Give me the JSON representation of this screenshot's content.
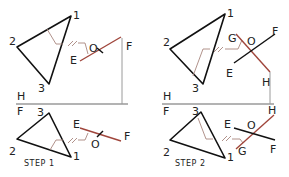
{
  "colors": {
    "triangle": "#111111",
    "cut_line": "#a0463c",
    "projection": "#a8867e",
    "fold_line": "#9a9a9a"
  },
  "fold_line_labels": {
    "upper": "H",
    "lower": "F"
  },
  "panels": [
    {
      "step_label": "STEP 1",
      "top_view": {
        "triangle_vertices": [
          "1",
          "2",
          "3"
        ],
        "line_endpoints": [
          "E",
          "F"
        ],
        "pierce_point": "O",
        "parallel_mark": "//"
      },
      "front_view": {
        "triangle_vertices": [
          "3",
          "2",
          "1"
        ],
        "line_endpoints": [
          "E",
          "F"
        ],
        "pierce_point": "O",
        "parallel_mark": "//"
      }
    },
    {
      "step_label": "STEP 2",
      "top_view": {
        "triangle_vertices": [
          "1",
          "2",
          "3"
        ],
        "line_endpoints": [
          "E",
          "F"
        ],
        "edge_view_points": [
          "G",
          "H"
        ],
        "pierce_point": "O",
        "parallel_mark": "//"
      },
      "front_view": {
        "triangle_vertices": [
          "3",
          "2",
          "1"
        ],
        "line_endpoints": [
          "E",
          "F"
        ],
        "edge_view_points": [
          "G",
          "H"
        ],
        "pierce_point": "O",
        "parallel_mark": "//"
      }
    }
  ]
}
